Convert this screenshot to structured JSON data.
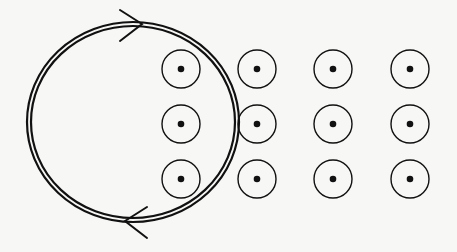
{
  "diagram": {
    "colors": {
      "background": "#f7f7f5",
      "stroke": "#111111"
    },
    "loop": {
      "cx": 133,
      "cy": 122,
      "rx": 104,
      "ry": 98,
      "gap": 4,
      "stroke_width": 2.2
    },
    "arrows": [
      {
        "name": "top-arrow",
        "direction": "right",
        "apex": [
          142,
          24
        ],
        "a": [
          120,
          10
        ],
        "b": [
          120,
          41
        ]
      },
      {
        "name": "bottom-arrow",
        "direction": "left",
        "apex": [
          125,
          221
        ],
        "a": [
          147,
          207
        ],
        "b": [
          147,
          238
        ]
      }
    ],
    "field": {
      "symbol": "dot-in-circle (out of page)",
      "radius": 19,
      "dot_radius": 3.3,
      "columns_x": [
        181,
        257,
        333,
        410
      ],
      "rows_y": [
        69,
        124,
        179
      ]
    }
  }
}
